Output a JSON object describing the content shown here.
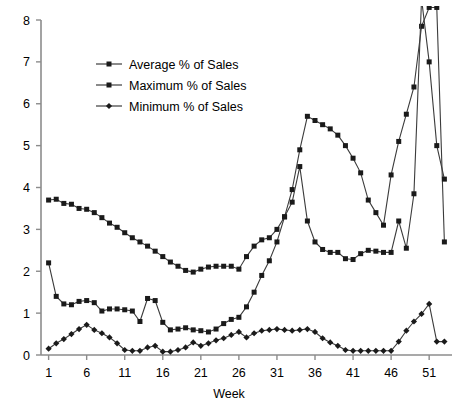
{
  "chart_data": {
    "type": "line",
    "title": "",
    "xlabel": "Week",
    "ylabel": "",
    "xlim": [
      0,
      54
    ],
    "ylim": [
      0,
      8
    ],
    "xticks": [
      1,
      6,
      11,
      16,
      21,
      26,
      31,
      36,
      41,
      46,
      51
    ],
    "yticks": [
      0,
      1,
      2,
      3,
      4,
      5,
      6,
      7,
      8
    ],
    "grid": false,
    "legend_position": "upper-left-inside",
    "marker_color": "#1a1a1a",
    "line_color": "#3b3b3b",
    "axis_color": "#8c8c8c",
    "x": [
      1,
      2,
      3,
      4,
      5,
      6,
      7,
      8,
      9,
      10,
      11,
      12,
      13,
      14,
      15,
      16,
      17,
      18,
      19,
      20,
      21,
      22,
      23,
      24,
      25,
      26,
      27,
      28,
      29,
      30,
      31,
      32,
      33,
      34,
      35,
      36,
      37,
      38,
      39,
      40,
      41,
      42,
      43,
      44,
      45,
      46,
      47,
      48,
      49,
      50,
      51,
      52,
      53
    ],
    "series": [
      {
        "name": "Average % of Sales",
        "marker": "square",
        "values": [
          3.7,
          3.72,
          3.62,
          3.6,
          3.5,
          3.48,
          3.4,
          3.28,
          3.15,
          3.05,
          2.92,
          2.8,
          2.7,
          2.6,
          2.48,
          2.35,
          2.22,
          2.12,
          2.02,
          1.98,
          2.05,
          2.1,
          2.12,
          2.12,
          2.12,
          2.05,
          2.35,
          2.6,
          2.75,
          2.8,
          3.0,
          3.3,
          3.95,
          4.9,
          5.7,
          5.6,
          5.5,
          5.4,
          5.25,
          5.0,
          4.7,
          4.35,
          3.7,
          3.4,
          3.1,
          4.3,
          5.1,
          5.75,
          6.4,
          7.85,
          8.3,
          8.3,
          2.7
        ]
      },
      {
        "name": "Maximum % of Sales",
        "marker": "square",
        "values": [
          2.2,
          1.4,
          1.22,
          1.2,
          1.28,
          1.3,
          1.25,
          1.05,
          1.1,
          1.1,
          1.08,
          1.05,
          0.8,
          1.35,
          1.3,
          0.78,
          0.6,
          0.62,
          0.65,
          0.6,
          0.58,
          0.55,
          0.62,
          0.75,
          0.85,
          0.9,
          1.15,
          1.5,
          1.9,
          2.25,
          2.7,
          3.3,
          3.65,
          4.5,
          3.2,
          2.7,
          2.52,
          2.45,
          2.45,
          2.3,
          2.28,
          2.42,
          2.5,
          2.48,
          2.45,
          2.45,
          3.2,
          2.55,
          3.85,
          8.5,
          7.0,
          5.0,
          4.2
        ]
      },
      {
        "name": "Minimum % of Sales",
        "marker": "diamond",
        "values": [
          0.15,
          0.28,
          0.38,
          0.5,
          0.62,
          0.72,
          0.6,
          0.52,
          0.42,
          0.28,
          0.12,
          0.1,
          0.1,
          0.18,
          0.22,
          0.08,
          0.08,
          0.12,
          0.18,
          0.3,
          0.22,
          0.28,
          0.35,
          0.4,
          0.48,
          0.55,
          0.42,
          0.52,
          0.58,
          0.6,
          0.62,
          0.6,
          0.58,
          0.6,
          0.62,
          0.55,
          0.4,
          0.3,
          0.22,
          0.12,
          0.1,
          0.1,
          0.1,
          0.1,
          0.1,
          0.1,
          0.32,
          0.58,
          0.8,
          0.98,
          1.22,
          0.32,
          0.32
        ]
      }
    ],
    "legend": [
      {
        "label": "Average % of Sales",
        "marker": "square"
      },
      {
        "label": "Maximum % of Sales",
        "marker": "square"
      },
      {
        "label": "Minimum % of Sales",
        "marker": "diamond"
      }
    ]
  }
}
